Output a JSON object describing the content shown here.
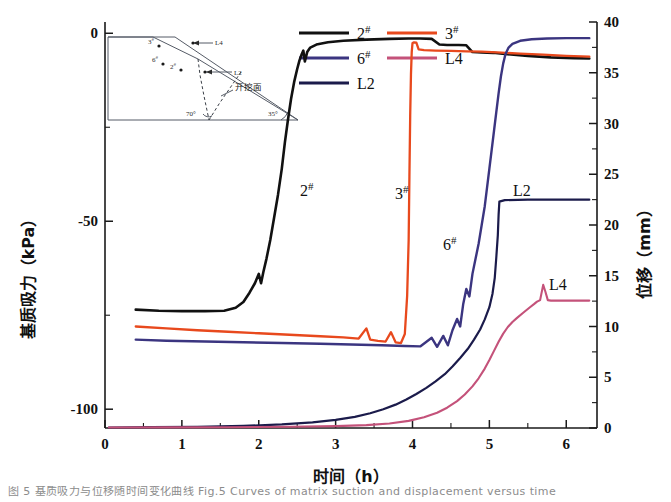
{
  "chart_data": {
    "type": "line",
    "title": "",
    "xlabel": "时间（h）",
    "ylabel_left": "基质吸力（kPa）",
    "ylabel_right": "位移（mm）",
    "xlim": [
      0,
      6.4
    ],
    "ylim_left": [
      -105,
      3
    ],
    "ylim_right": [
      0,
      40
    ],
    "grid": false,
    "legend_position": "top-center",
    "x_ticks": [
      0,
      1,
      2,
      3,
      4,
      5,
      6
    ],
    "x_tick_labels": [
      "0",
      "1",
      "2",
      "3",
      "4",
      "5",
      "6"
    ],
    "y_left_ticks": [
      -100,
      -50,
      0
    ],
    "y_left_tick_labels": [
      "-100",
      "-50",
      "0"
    ],
    "y_right_ticks": [
      0,
      5,
      10,
      15,
      20,
      25,
      30,
      35,
      40
    ],
    "y_right_tick_labels": [
      "0",
      "5",
      "10",
      "15",
      "20",
      "25",
      "30",
      "35",
      "40"
    ],
    "series": [
      {
        "name": "2#",
        "axis": "left",
        "color": "#111111",
        "inplot_label": "2",
        "inplot_label_sup": "#",
        "points": [
          [
            0.4,
            -73.5
          ],
          [
            0.7,
            -73.8
          ],
          [
            1.0,
            -73.9
          ],
          [
            1.3,
            -73.9
          ],
          [
            1.55,
            -73.8
          ],
          [
            1.7,
            -73.0
          ],
          [
            1.8,
            -71.5
          ],
          [
            1.88,
            -69.0
          ],
          [
            1.95,
            -66.5
          ],
          [
            2.0,
            -64.0
          ],
          [
            2.03,
            -66.5
          ],
          [
            2.06,
            -63.5
          ],
          [
            2.1,
            -60.0
          ],
          [
            2.15,
            -55.0
          ],
          [
            2.2,
            -49.0
          ],
          [
            2.25,
            -43.0
          ],
          [
            2.3,
            -36.0
          ],
          [
            2.34,
            -29.0
          ],
          [
            2.38,
            -23.0
          ],
          [
            2.42,
            -17.5
          ],
          [
            2.46,
            -13.0
          ],
          [
            2.5,
            -9.5
          ],
          [
            2.53,
            -7.2
          ],
          [
            2.56,
            -5.5
          ],
          [
            2.58,
            -4.6
          ],
          [
            2.6,
            -7.5
          ],
          [
            2.63,
            -5.0
          ],
          [
            2.67,
            -3.8
          ],
          [
            2.75,
            -3.0
          ],
          [
            2.9,
            -2.4
          ],
          [
            3.1,
            -2.0
          ],
          [
            3.4,
            -1.7
          ],
          [
            3.7,
            -1.5
          ],
          [
            3.95,
            -1.4
          ],
          [
            4.1,
            -1.4
          ],
          [
            4.25,
            -1.5
          ],
          [
            4.35,
            -3.0
          ],
          [
            4.45,
            -3.1
          ],
          [
            4.6,
            -3.1
          ],
          [
            4.7,
            -3.2
          ],
          [
            4.78,
            -5.0
          ],
          [
            4.9,
            -5.1
          ],
          [
            5.05,
            -5.2
          ],
          [
            5.2,
            -5.5
          ],
          [
            5.5,
            -6.0
          ],
          [
            5.8,
            -6.4
          ],
          [
            6.1,
            -6.6
          ],
          [
            6.3,
            -6.7
          ]
        ]
      },
      {
        "name": "3#",
        "axis": "left",
        "color": "#E8491D",
        "inplot_label": "3",
        "inplot_label_sup": "#",
        "points": [
          [
            0.4,
            -78.0
          ],
          [
            0.8,
            -78.5
          ],
          [
            1.2,
            -79.0
          ],
          [
            1.6,
            -79.4
          ],
          [
            2.0,
            -79.8
          ],
          [
            2.4,
            -80.2
          ],
          [
            2.8,
            -80.6
          ],
          [
            3.1,
            -80.9
          ],
          [
            3.3,
            -81.2
          ],
          [
            3.4,
            -78.5
          ],
          [
            3.45,
            -81.5
          ],
          [
            3.55,
            -81.8
          ],
          [
            3.65,
            -82.0
          ],
          [
            3.72,
            -79.5
          ],
          [
            3.78,
            -82.2
          ],
          [
            3.85,
            -82.4
          ],
          [
            3.9,
            -80.0
          ],
          [
            3.93,
            -70.0
          ],
          [
            3.95,
            -55.0
          ],
          [
            3.96,
            -38.0
          ],
          [
            3.97,
            -22.0
          ],
          [
            3.98,
            -11.0
          ],
          [
            3.99,
            -5.0
          ],
          [
            4.0,
            -2.6
          ],
          [
            4.02,
            -2.4
          ],
          [
            4.05,
            -2.5
          ],
          [
            4.08,
            -4.3
          ],
          [
            4.15,
            -4.5
          ],
          [
            4.3,
            -4.6
          ],
          [
            4.5,
            -4.7
          ],
          [
            4.7,
            -4.8
          ],
          [
            4.9,
            -4.9
          ],
          [
            5.1,
            -5.1
          ],
          [
            5.4,
            -5.4
          ],
          [
            5.7,
            -5.7
          ],
          [
            6.0,
            -6.0
          ],
          [
            6.3,
            -6.2
          ]
        ]
      },
      {
        "name": "6#",
        "axis": "left",
        "color": "#3B3580",
        "inplot_label": "6",
        "inplot_label_sup": "#",
        "points": [
          [
            0.4,
            -81.5
          ],
          [
            0.8,
            -81.8
          ],
          [
            1.3,
            -82.0
          ],
          [
            1.8,
            -82.2
          ],
          [
            2.3,
            -82.4
          ],
          [
            2.8,
            -82.6
          ],
          [
            3.2,
            -82.8
          ],
          [
            3.6,
            -83.0
          ],
          [
            3.9,
            -83.2
          ],
          [
            4.1,
            -83.3
          ],
          [
            4.25,
            -81.0
          ],
          [
            4.32,
            -83.4
          ],
          [
            4.4,
            -80.5
          ],
          [
            4.46,
            -83.0
          ],
          [
            4.52,
            -79.0
          ],
          [
            4.58,
            -76.0
          ],
          [
            4.62,
            -78.0
          ],
          [
            4.66,
            -72.0
          ],
          [
            4.7,
            -68.0
          ],
          [
            4.74,
            -70.0
          ],
          [
            4.78,
            -64.0
          ],
          [
            4.82,
            -60.0
          ],
          [
            4.86,
            -56.0
          ],
          [
            4.9,
            -51.0
          ],
          [
            4.94,
            -46.0
          ],
          [
            4.97,
            -41.0
          ],
          [
            5.0,
            -36.0
          ],
          [
            5.03,
            -31.0
          ],
          [
            5.06,
            -26.0
          ],
          [
            5.09,
            -21.0
          ],
          [
            5.12,
            -16.0
          ],
          [
            5.15,
            -11.5
          ],
          [
            5.18,
            -8.0
          ],
          [
            5.21,
            -5.5
          ],
          [
            5.25,
            -3.8
          ],
          [
            5.3,
            -2.8
          ],
          [
            5.4,
            -2.0
          ],
          [
            5.55,
            -1.6
          ],
          [
            5.75,
            -1.4
          ],
          [
            6.0,
            -1.3
          ],
          [
            6.3,
            -1.3
          ]
        ]
      },
      {
        "name": "L2",
        "axis": "right",
        "color": "#1B1B4B",
        "inplot_label": "L2",
        "inplot_label_sup": "",
        "points": [
          [
            0.05,
            0.05
          ],
          [
            0.6,
            0.08
          ],
          [
            1.2,
            0.12
          ],
          [
            1.8,
            0.2
          ],
          [
            2.3,
            0.35
          ],
          [
            2.7,
            0.55
          ],
          [
            3.0,
            0.8
          ],
          [
            3.25,
            1.1
          ],
          [
            3.45,
            1.45
          ],
          [
            3.62,
            1.85
          ],
          [
            3.78,
            2.3
          ],
          [
            3.92,
            2.8
          ],
          [
            4.05,
            3.35
          ],
          [
            4.18,
            3.95
          ],
          [
            4.3,
            4.6
          ],
          [
            4.42,
            5.3
          ],
          [
            4.52,
            6.05
          ],
          [
            4.62,
            6.9
          ],
          [
            4.72,
            7.8
          ],
          [
            4.8,
            8.7
          ],
          [
            4.88,
            9.7
          ],
          [
            4.94,
            10.7
          ],
          [
            5.0,
            11.9
          ],
          [
            5.04,
            13.2
          ],
          [
            5.07,
            14.8
          ],
          [
            5.09,
            16.8
          ],
          [
            5.11,
            19.0
          ],
          [
            5.12,
            21.0
          ],
          [
            5.13,
            22.3
          ],
          [
            5.2,
            22.45
          ],
          [
            5.5,
            22.5
          ],
          [
            5.9,
            22.5
          ],
          [
            6.3,
            22.5
          ]
        ]
      },
      {
        "name": "L4",
        "axis": "right",
        "color": "#C4527A",
        "inplot_label": "L4",
        "inplot_label_sup": "",
        "points": [
          [
            0.05,
            0.05
          ],
          [
            0.8,
            0.06
          ],
          [
            1.6,
            0.08
          ],
          [
            2.4,
            0.12
          ],
          [
            3.0,
            0.18
          ],
          [
            3.4,
            0.28
          ],
          [
            3.7,
            0.45
          ],
          [
            3.95,
            0.7
          ],
          [
            4.15,
            1.05
          ],
          [
            4.32,
            1.5
          ],
          [
            4.45,
            2.0
          ],
          [
            4.58,
            2.65
          ],
          [
            4.68,
            3.3
          ],
          [
            4.78,
            4.1
          ],
          [
            4.86,
            4.9
          ],
          [
            4.94,
            5.85
          ],
          [
            5.0,
            6.7
          ],
          [
            5.06,
            7.6
          ],
          [
            5.12,
            8.5
          ],
          [
            5.18,
            9.3
          ],
          [
            5.24,
            9.95
          ],
          [
            5.3,
            10.45
          ],
          [
            5.36,
            10.85
          ],
          [
            5.44,
            11.35
          ],
          [
            5.52,
            11.85
          ],
          [
            5.58,
            12.2
          ],
          [
            5.62,
            12.45
          ],
          [
            5.66,
            12.6
          ],
          [
            5.7,
            14.1
          ],
          [
            5.73,
            13.4
          ],
          [
            5.76,
            12.6
          ],
          [
            5.8,
            12.55
          ],
          [
            5.95,
            12.55
          ],
          [
            6.15,
            12.55
          ],
          [
            6.3,
            12.55
          ]
        ]
      }
    ]
  },
  "legend": {
    "entries": [
      {
        "label": "2",
        "sup": "#",
        "color": "#111111"
      },
      {
        "label": "3",
        "sup": "#",
        "color": "#E8491D"
      },
      {
        "label": "6",
        "sup": "#",
        "color": "#3B3580"
      },
      {
        "label": "L4",
        "sup": "",
        "color": "#C4527A"
      },
      {
        "label": "L2",
        "sup": "",
        "color": "#1B1B4B"
      }
    ]
  },
  "inset": {
    "name": "slope-excavation-diagram",
    "sensor_labels": [
      "3",
      "6",
      "2"
    ],
    "sensor_sups": [
      "#",
      "#",
      "#"
    ],
    "line_labels": [
      "L4",
      "L2"
    ],
    "face_label": "开挖面",
    "angle_left": "70°",
    "angle_right": "35°"
  },
  "caption": {
    "text": "图 5   基质吸力与位移随时间变化曲线   Fig.5   Curves of matrix suction and displacement versus time"
  }
}
